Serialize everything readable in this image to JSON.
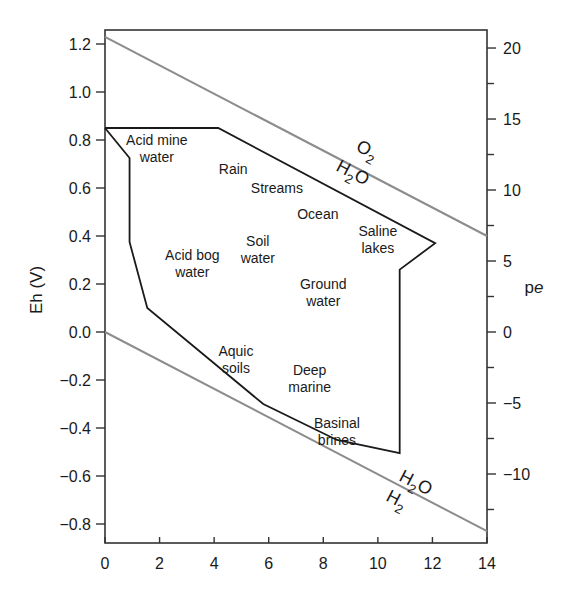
{
  "chart_data": {
    "type": "line",
    "title": "",
    "xlabel": "",
    "ylabel": "Eh (V)",
    "ylabel_right": "pe",
    "xlim": [
      0,
      14
    ],
    "ylim": [
      -0.87,
      1.27
    ],
    "ylim_right_pe": [
      -14.7,
      21.5
    ],
    "grid": false,
    "x_ticks": [
      0,
      2,
      4,
      6,
      8,
      10,
      12,
      14
    ],
    "y_ticks": [
      1.2,
      1.0,
      0.8,
      0.6,
      0.4,
      0.2,
      0.0,
      -0.2,
      -0.4,
      -0.6,
      -0.8
    ],
    "y_tick_labels": [
      "1.2",
      "1.0",
      "0.8",
      "0.6",
      "0.4",
      "0.2",
      "0.0",
      "−0.2",
      "−0.4",
      "−0.6",
      "−0.8"
    ],
    "y_right_ticks": [
      20,
      15,
      10,
      5,
      0,
      -5,
      -10
    ],
    "y_right_tick_labels": [
      "20",
      "15",
      "10",
      "5",
      "0",
      "−5",
      "−10"
    ],
    "series": [
      {
        "name": "O2/H2O upper stability limit",
        "color": "#8c8c8c",
        "x": [
          0,
          14
        ],
        "y": [
          1.23,
          0.4
        ]
      },
      {
        "name": "H2O/H2 lower stability limit",
        "color": "#8c8c8c",
        "x": [
          0,
          14
        ],
        "y": [
          0.0,
          -0.83
        ]
      },
      {
        "name": "Natural waters envelope",
        "color": "#1a1a1a",
        "closed": true,
        "x": [
          0,
          4.15,
          12.1,
          10.8,
          10.8,
          8.5,
          5.8,
          1.55,
          0.9,
          0.9,
          0
        ],
        "y": [
          0.85,
          0.85,
          0.37,
          0.26,
          -0.505,
          -0.45,
          -0.3,
          0.1,
          0.375,
          0.725,
          0.85
        ]
      }
    ],
    "line_labels": [
      {
        "text": "O",
        "sub": "2",
        "x": 8.5,
        "y": 0.7
      },
      {
        "text": "H",
        "sub": "2",
        "tail": "O",
        "x": 8.5,
        "y": 0.6,
        "position": "upper"
      },
      {
        "text": "H",
        "sub": "2",
        "tail": "O",
        "x": 11.2,
        "y": -0.58,
        "position": "lower"
      },
      {
        "text": "H",
        "sub": "2",
        "x": 11.2,
        "y": -0.68
      }
    ],
    "annotations": [
      {
        "lines": [
          "Acid mine",
          "water"
        ],
        "x": 1.9,
        "y": 0.78
      },
      {
        "lines": [
          "Rain"
        ],
        "x": 4.7,
        "y": 0.66
      },
      {
        "lines": [
          "Streams"
        ],
        "x": 6.3,
        "y": 0.58
      },
      {
        "lines": [
          "Ocean"
        ],
        "x": 7.8,
        "y": 0.47
      },
      {
        "lines": [
          "Saline",
          "lakes"
        ],
        "x": 10.0,
        "y": 0.4
      },
      {
        "lines": [
          "Soil",
          "water"
        ],
        "x": 5.6,
        "y": 0.36
      },
      {
        "lines": [
          "Acid bog",
          "water"
        ],
        "x": 3.2,
        "y": 0.3
      },
      {
        "lines": [
          "Ground",
          "water"
        ],
        "x": 8.0,
        "y": 0.18
      },
      {
        "lines": [
          "Aquic",
          "soils"
        ],
        "x": 4.8,
        "y": -0.1
      },
      {
        "lines": [
          "Deep",
          "marine"
        ],
        "x": 7.5,
        "y": -0.18
      },
      {
        "lines": [
          "Basinal",
          "brines"
        ],
        "x": 8.5,
        "y": -0.4
      }
    ]
  }
}
